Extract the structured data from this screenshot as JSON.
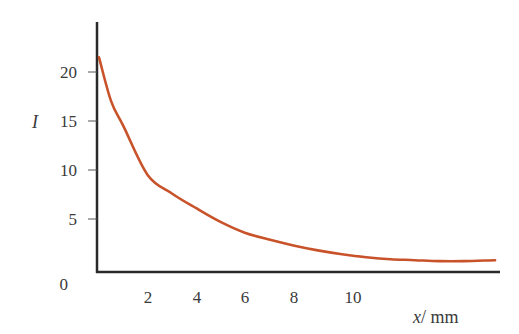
{
  "chart_data": {
    "type": "line",
    "title": "",
    "xlabel": "x / mm",
    "xlabel_var": "x",
    "xlabel_unit": "/ mm",
    "ylabel": "I",
    "x_ticks": [
      2,
      4,
      6,
      8,
      10
    ],
    "y_ticks": [
      0,
      5,
      10,
      15,
      20
    ],
    "xlim": [
      0,
      16.6
    ],
    "ylim": [
      0,
      20.5
    ],
    "grid": false,
    "legend": null,
    "series": [
      {
        "name": "I",
        "color": "#c8532a",
        "x": [
          0,
          0.5,
          1,
          2,
          3,
          4,
          5,
          6,
          7,
          8,
          9,
          10,
          11,
          12,
          13,
          14,
          15,
          16.3
        ],
        "y": [
          21.5,
          17.0,
          14.5,
          9.5,
          7.6,
          6.1,
          4.7,
          3.6,
          2.9,
          2.3,
          1.8,
          1.4,
          1.1,
          0.9,
          0.8,
          0.7,
          0.7,
          0.8
        ]
      }
    ]
  },
  "axes": {
    "x_tick_labels": [
      "2",
      "4",
      "6",
      "8",
      "10"
    ],
    "y_tick_labels": [
      "0",
      "5",
      "10",
      "15",
      "20"
    ],
    "x_label_var": "x",
    "x_label_unit": "/ mm",
    "y_label": "I",
    "axis_color": "#2a2a2a"
  }
}
